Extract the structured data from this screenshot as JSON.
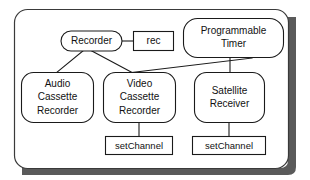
{
  "diagram": {
    "kind": "object-model-diagram",
    "background_color": "#ffffff",
    "line_color": "#1a1a1a",
    "text_color": "#111111",
    "shadow_color": "#5a5a5a",
    "container": {
      "name": "outer-container",
      "shape": "rounded-rectangle",
      "has_shadow": true,
      "label": ""
    },
    "nodes": [
      {
        "id": "recorder",
        "label": "Recorder",
        "shape": "rounded-ellipse",
        "lines": [
          "Recorder"
        ]
      },
      {
        "id": "rec",
        "label": "rec",
        "shape": "rectangle",
        "lines": [
          "rec"
        ]
      },
      {
        "id": "programmable-timer",
        "label": "Programmable Timer",
        "shape": "rounded-rectangle",
        "lines": [
          "Programmable",
          "Timer"
        ]
      },
      {
        "id": "audio-cassette-recorder",
        "label": "Audio Cassette Recorder",
        "shape": "rounded-rectangle",
        "lines": [
          "Audio",
          "Cassette",
          "Recorder"
        ]
      },
      {
        "id": "video-cassette-recorder",
        "label": "Video Cassette Recorder",
        "shape": "rounded-rectangle",
        "lines": [
          "Video",
          "Cassette",
          "Recorder"
        ]
      },
      {
        "id": "satellite-receiver",
        "label": "Satellite Receiver",
        "shape": "rounded-rectangle",
        "lines": [
          "Satellite",
          "Receiver"
        ]
      },
      {
        "id": "set-channel-video",
        "label": "setChannel",
        "shape": "rectangle",
        "lines": [
          "setChannel"
        ]
      },
      {
        "id": "set-channel-satellite",
        "label": "setChannel",
        "shape": "rectangle",
        "lines": [
          "setChannel"
        ]
      }
    ],
    "edges": [
      {
        "from": "recorder",
        "to": "rec",
        "style": "solid"
      },
      {
        "from": "recorder",
        "to": "audio-cassette-recorder",
        "style": "solid"
      },
      {
        "from": "recorder",
        "to": "video-cassette-recorder",
        "style": "solid"
      },
      {
        "from": "programmable-timer",
        "to": "video-cassette-recorder",
        "style": "solid"
      },
      {
        "from": "programmable-timer",
        "to": "satellite-receiver",
        "style": "solid"
      },
      {
        "from": "video-cassette-recorder",
        "to": "set-channel-video",
        "style": "solid"
      },
      {
        "from": "satellite-receiver",
        "to": "set-channel-satellite",
        "style": "solid"
      }
    ]
  }
}
